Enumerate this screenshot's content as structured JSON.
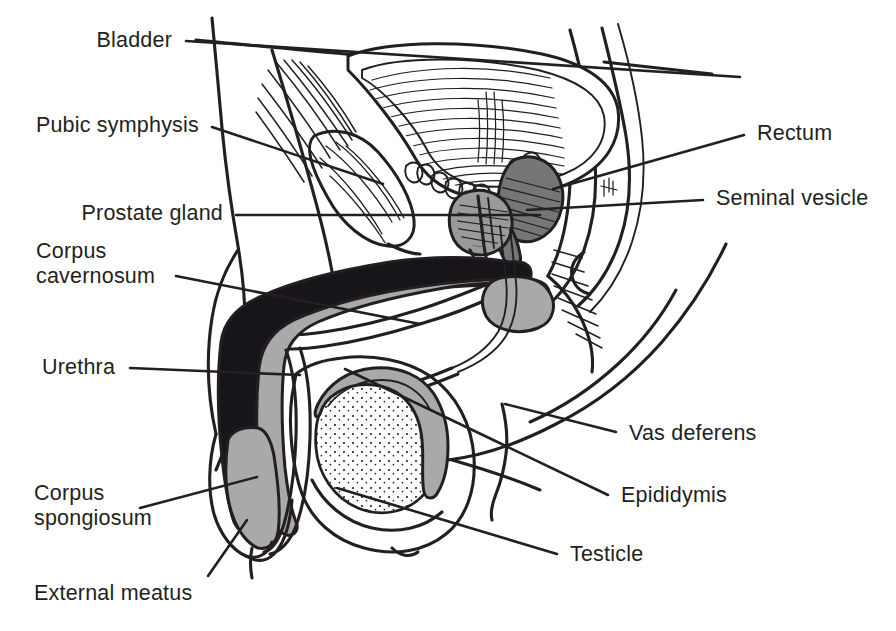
{
  "figure": {
    "kind": "anatomical-line-diagram",
    "width": 896,
    "height": 631,
    "background_color": "#ffffff",
    "ink_color": "#231f20"
  },
  "palette": {
    "ink": "#231f20",
    "corpus_cavernosum_fill": "#17151a",
    "corpus_spongiosum_fill": "#a9a9a9",
    "prostate_fill": "#9a9a9a",
    "seminal_vesicle_fill": "#767676",
    "paper": "#ffffff"
  },
  "labels": [
    {
      "id": "bladder",
      "name": "Bladder",
      "lines": [
        "Bladder"
      ],
      "side": "left",
      "text_anchor": "end",
      "text_x": 172,
      "text_y": 47,
      "leader": "M 186 41 L 740 77"
    },
    {
      "id": "pubic-symphysis",
      "name": "Pubic symphysis",
      "lines": [
        "Pubic symphysis"
      ],
      "side": "left",
      "text_anchor": "end",
      "text_x": 199,
      "text_y": 132,
      "leader": "M 212 127 L 383 184"
    },
    {
      "id": "prostate-gland",
      "name": "Prostate gland",
      "lines": [
        "Prostate gland"
      ],
      "side": "left",
      "text_anchor": "end",
      "text_x": 223,
      "text_y": 220,
      "leader": "M 236 215 L 540 215"
    },
    {
      "id": "corpus-cavernosum",
      "name": "Corpus cavernosum",
      "lines": [
        "Corpus",
        "cavernosum"
      ],
      "side": "left",
      "text_anchor": "start",
      "text_x": 36,
      "text_y": 258,
      "line_height": 25,
      "leader": "M 176 276 L 420 324"
    },
    {
      "id": "urethra",
      "name": "Urethra",
      "lines": [
        "Urethra"
      ],
      "side": "left",
      "text_anchor": "start",
      "text_x": 42,
      "text_y": 374,
      "leader": "M 130 368 L 300 375"
    },
    {
      "id": "corpus-spongiosum",
      "name": "Corpus spongiosum",
      "lines": [
        "Corpus",
        "spongiosum"
      ],
      "side": "left",
      "text_anchor": "start",
      "text_x": 34,
      "text_y": 500,
      "line_height": 25,
      "leader": "M 140 508 L 257 477"
    },
    {
      "id": "external-meatus",
      "name": "External meatus",
      "lines": [
        "External meatus"
      ],
      "side": "left",
      "text_anchor": "start",
      "text_x": 34,
      "text_y": 600,
      "leader": "M 208 576 L 247 520"
    },
    {
      "id": "rectum",
      "name": "Rectum",
      "lines": [
        "Rectum"
      ],
      "side": "right",
      "text_anchor": "start",
      "text_x": 757,
      "text_y": 140,
      "leader": "M 744 135 L 553 189"
    },
    {
      "id": "seminal-vesicle",
      "name": "Seminal vesicle",
      "lines": [
        "Seminal vesicle"
      ],
      "side": "right",
      "text_anchor": "start",
      "text_x": 716,
      "text_y": 205,
      "leader": "M 703 200 L 527 210"
    },
    {
      "id": "vas-deferens",
      "name": "Vas deferens",
      "lines": [
        "Vas deferens"
      ],
      "side": "right",
      "text_anchor": "start",
      "text_x": 629,
      "text_y": 440,
      "leader": "M 616 432 L 505 404"
    },
    {
      "id": "epididymis",
      "name": "Epididymis",
      "lines": [
        "Epididymis"
      ],
      "side": "right",
      "text_anchor": "start",
      "text_x": 621,
      "text_y": 502,
      "leader": "M 608 495 L 345 369"
    },
    {
      "id": "testicle",
      "name": "Testicle",
      "lines": [
        "Testicle"
      ],
      "side": "right",
      "text_anchor": "start",
      "text_x": 570,
      "text_y": 561,
      "leader": "M 557 554 L 337 488"
    }
  ],
  "structures": [
    {
      "id": "body-outline",
      "name": "Body wall outline"
    },
    {
      "id": "bladder",
      "name": "Bladder with rugae"
    },
    {
      "id": "pubic-symphysis",
      "name": "Pubic symphysis"
    },
    {
      "id": "prostate-gland",
      "name": "Prostate gland"
    },
    {
      "id": "seminal-vesicle",
      "name": "Seminal vesicle"
    },
    {
      "id": "rectum",
      "name": "Rectum"
    },
    {
      "id": "corpus-cavernosum",
      "name": "Corpus cavernosum"
    },
    {
      "id": "corpus-spongiosum",
      "name": "Corpus spongiosum"
    },
    {
      "id": "urethra",
      "name": "Urethra"
    },
    {
      "id": "glans-meatus",
      "name": "Glans and external meatus"
    },
    {
      "id": "testicle",
      "name": "Testicle"
    },
    {
      "id": "epididymis",
      "name": "Epididymis"
    },
    {
      "id": "vas-deferens",
      "name": "Vas deferens"
    },
    {
      "id": "scrotum",
      "name": "Scrotum"
    }
  ]
}
